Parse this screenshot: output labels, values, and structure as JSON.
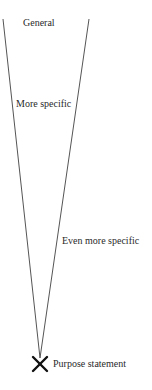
{
  "diagram": {
    "type": "inverted-funnel",
    "levels": [
      {
        "label": "General"
      },
      {
        "label": "More specific"
      },
      {
        "label": "Even more specific"
      }
    ],
    "endpoint": {
      "label": "Purpose statement",
      "marker": "x-mark-icon"
    },
    "colors": {
      "line": "#555555",
      "text": "#2a2a2a",
      "background": "#ffffff"
    }
  }
}
